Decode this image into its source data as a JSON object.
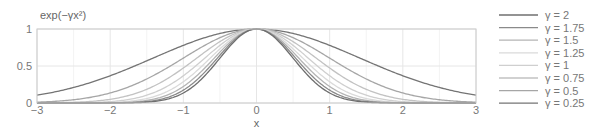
{
  "chart_data": {
    "type": "line",
    "title": "",
    "ylabel": "exp(−γx²)",
    "xlabel": "x",
    "xlim": [
      -3,
      3
    ],
    "ylim": [
      0,
      1
    ],
    "grid": true,
    "legend_position": "right",
    "x_ticks": [
      -3,
      -2,
      -1,
      0,
      1,
      2,
      3
    ],
    "x_tick_labels": [
      "−3",
      "−2",
      "−1",
      "0",
      "1",
      "2",
      "3"
    ],
    "y_ticks": [
      0,
      0.5,
      1
    ],
    "y_tick_labels": [
      "0",
      "0.5",
      "1"
    ],
    "function": "y = exp(-gamma * x^2)",
    "series": [
      {
        "name": "γ = 2",
        "gamma": 2,
        "color": "#6f6f6f"
      },
      {
        "name": "γ = 1.75",
        "gamma": 1.75,
        "color": "#8a8a8a"
      },
      {
        "name": "γ = 1.5",
        "gamma": 1.5,
        "color": "#b4b4b4"
      },
      {
        "name": "γ = 1.25",
        "gamma": 1.25,
        "color": "#dadada"
      },
      {
        "name": "γ = 1",
        "gamma": 1,
        "color": "#cfcfcf"
      },
      {
        "name": "γ = 0.75",
        "gamma": 0.75,
        "color": "#c2c2c2"
      },
      {
        "name": "γ = 0.5",
        "gamma": 0.5,
        "color": "#a6a6a6"
      },
      {
        "name": "γ = 0.25",
        "gamma": 0.25,
        "color": "#747474"
      }
    ]
  },
  "layout": {
    "plot": {
      "left": 37,
      "top": 29,
      "right": 476,
      "bottom": 103
    },
    "legend": {
      "x_line_start": 499,
      "x_line_end": 538,
      "x_text": 545,
      "y_start": 15,
      "row_height": 12.6
    }
  },
  "colors": {
    "frame": "#cccccc",
    "grid": "#e6e6e6",
    "text": "#777777"
  }
}
